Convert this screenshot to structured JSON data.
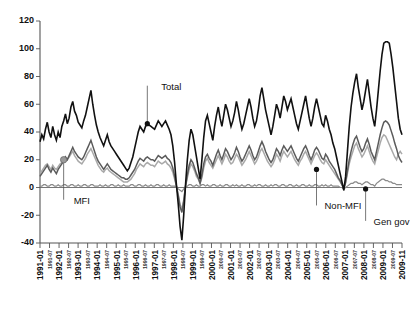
{
  "chart_data": {
    "type": "line",
    "title": "",
    "subtitle": "",
    "xlabel": "",
    "ylabel": "",
    "ylim": [
      -40,
      120
    ],
    "ytick_values": [
      -40,
      -20,
      0,
      20,
      40,
      60,
      80,
      100,
      120
    ],
    "ytick_labels": [
      "-40",
      "-20",
      "0",
      "20",
      "40",
      "60",
      "80",
      "100",
      "120"
    ],
    "grid": false,
    "legend_position": "inline-annotations",
    "x_start": "1991-01",
    "x_end": "2009-11",
    "x_major_labels": [
      "1991-01",
      "1992-01",
      "1993-01",
      "1994-01",
      "1995-01",
      "1996-01",
      "1997-01",
      "1998-01",
      "1999-01",
      "2000-01",
      "2001-01",
      "2002-01",
      "2003-01",
      "2004-01",
      "2005-01",
      "2006-01",
      "2007-01",
      "2008-01",
      "2009-01",
      "2009-11"
    ],
    "x_minor_labels": [
      "1991-07",
      "1992-07",
      "1993-07",
      "1994-07",
      "1995-07",
      "1996-07",
      "1997-07",
      "1998-07",
      "1999-07",
      "2000-07",
      "2001-07",
      "2002-07",
      "2003-07",
      "2004-07",
      "2005-07",
      "2006-07",
      "2007-07",
      "2008-07",
      "2009-07"
    ],
    "x_tick_labels_all": [
      "1991-01",
      "1991-07",
      "1992-01",
      "1992-07",
      "1993-01",
      "1993-07",
      "1994-01",
      "1994-07",
      "1995-01",
      "1995-07",
      "1996-01",
      "1996-07",
      "1997-01",
      "1997-07",
      "1998-01",
      "1998-07",
      "1999-01",
      "1999-07",
      "2000-01",
      "2000-07",
      "2001-01",
      "2001-07",
      "2002-01",
      "2002-07",
      "2003-01",
      "2003-07",
      "2004-01",
      "2004-07",
      "2005-01",
      "2005-07",
      "2006-01",
      "2006-07",
      "2007-01",
      "2007-07",
      "2008-01",
      "2008-07",
      "2009-01",
      "2009-07",
      "2009-11"
    ],
    "series": [
      {
        "name": "Total",
        "color": "#111111",
        "values": [
          33,
          38,
          35,
          42,
          47,
          40,
          36,
          44,
          38,
          34,
          40,
          36,
          44,
          48,
          53,
          46,
          50,
          58,
          62,
          55,
          52,
          47,
          45,
          43,
          48,
          52,
          58,
          64,
          70,
          60,
          52,
          45,
          40,
          36,
          33,
          30,
          34,
          38,
          33,
          30,
          28,
          26,
          24,
          22,
          20,
          18,
          16,
          14,
          12,
          14,
          18,
          22,
          28,
          34,
          40,
          44,
          42,
          40,
          44,
          46,
          45,
          44,
          43,
          42,
          45,
          48,
          46,
          44,
          46,
          48,
          45,
          42,
          38,
          30,
          18,
          2,
          -12,
          -28,
          -38,
          -20,
          2,
          20,
          34,
          42,
          38,
          30,
          22,
          14,
          6,
          20,
          36,
          48,
          52,
          46,
          40,
          34,
          44,
          52,
          58,
          50,
          44,
          52,
          60,
          56,
          50,
          44,
          48,
          54,
          62,
          56,
          48,
          42,
          46,
          52,
          58,
          64,
          58,
          50,
          44,
          48,
          56,
          66,
          72,
          64,
          56,
          50,
          44,
          38,
          44,
          52,
          60,
          56,
          50,
          58,
          66,
          62,
          56,
          60,
          64,
          58,
          52,
          46,
          42,
          48,
          54,
          60,
          66,
          58,
          50,
          44,
          50,
          58,
          64,
          58,
          52,
          46,
          44,
          52,
          48,
          42,
          38,
          32,
          28,
          22,
          16,
          10,
          4,
          -2,
          8,
          26,
          44,
          58,
          68,
          76,
          82,
          72,
          64,
          56,
          62,
          70,
          78,
          68,
          58,
          50,
          44,
          56,
          70,
          84,
          96,
          104,
          105,
          105,
          104,
          96,
          86,
          74,
          62,
          50,
          42,
          38
        ]
      },
      {
        "name": "Non-MFI",
        "color": "#5b5b5b",
        "values": [
          8,
          10,
          12,
          14,
          16,
          13,
          11,
          14,
          12,
          10,
          13,
          15,
          17,
          19,
          22,
          20,
          23,
          26,
          29,
          26,
          24,
          22,
          21,
          20,
          22,
          25,
          28,
          31,
          34,
          30,
          26,
          22,
          19,
          17,
          15,
          13,
          15,
          17,
          15,
          13,
          12,
          11,
          10,
          9,
          8,
          7,
          7,
          6,
          6,
          7,
          9,
          11,
          13,
          16,
          19,
          21,
          20,
          19,
          21,
          22,
          21,
          20,
          20,
          19,
          21,
          23,
          22,
          21,
          22,
          23,
          21,
          20,
          18,
          14,
          8,
          1,
          -6,
          -14,
          -18,
          -10,
          1,
          9,
          16,
          20,
          18,
          14,
          10,
          7,
          3,
          9,
          17,
          22,
          24,
          21,
          19,
          16,
          20,
          24,
          27,
          23,
          20,
          24,
          28,
          26,
          23,
          20,
          22,
          25,
          29,
          26,
          22,
          19,
          21,
          24,
          27,
          30,
          27,
          23,
          20,
          22,
          26,
          30,
          33,
          30,
          26,
          23,
          20,
          18,
          20,
          24,
          28,
          26,
          23,
          27,
          30,
          28,
          26,
          28,
          30,
          27,
          24,
          21,
          19,
          22,
          25,
          28,
          30,
          27,
          23,
          20,
          23,
          27,
          29,
          27,
          24,
          21,
          20,
          24,
          22,
          19,
          17,
          15,
          13,
          10,
          7,
          5,
          2,
          -1,
          4,
          12,
          20,
          26,
          31,
          35,
          37,
          33,
          29,
          26,
          28,
          32,
          35,
          31,
          26,
          23,
          20,
          26,
          32,
          38,
          43,
          47,
          48,
          47,
          45,
          41,
          37,
          32,
          28,
          23,
          20,
          18
        ]
      },
      {
        "name": "MFI",
        "color": "#a9a9a9",
        "values": [
          10,
          12,
          14,
          16,
          17,
          15,
          13,
          16,
          14,
          13,
          15,
          17,
          18,
          20,
          22,
          20,
          22,
          24,
          26,
          23,
          21,
          19,
          18,
          17,
          19,
          21,
          24,
          26,
          28,
          25,
          22,
          19,
          16,
          14,
          12,
          11,
          13,
          14,
          12,
          11,
          10,
          9,
          8,
          7,
          6,
          5,
          4,
          4,
          4,
          5,
          6,
          8,
          10,
          13,
          15,
          17,
          16,
          15,
          17,
          18,
          17,
          16,
          16,
          15,
          17,
          19,
          18,
          17,
          18,
          19,
          17,
          16,
          14,
          11,
          6,
          1,
          -5,
          -12,
          -16,
          -9,
          1,
          7,
          13,
          17,
          15,
          12,
          8,
          6,
          3,
          7,
          14,
          19,
          21,
          18,
          16,
          14,
          17,
          20,
          23,
          20,
          17,
          20,
          24,
          22,
          19,
          17,
          18,
          21,
          24,
          22,
          19,
          16,
          18,
          20,
          23,
          26,
          23,
          20,
          17,
          19,
          22,
          26,
          28,
          25,
          22,
          19,
          17,
          15,
          17,
          20,
          24,
          22,
          19,
          23,
          26,
          24,
          22,
          24,
          26,
          23,
          20,
          18,
          16,
          19,
          21,
          24,
          26,
          23,
          20,
          17,
          20,
          23,
          25,
          23,
          20,
          18,
          17,
          20,
          18,
          16,
          14,
          12,
          10,
          8,
          6,
          4,
          2,
          0,
          3,
          10,
          17,
          22,
          26,
          30,
          32,
          28,
          25,
          22,
          24,
          27,
          30,
          26,
          22,
          19,
          17,
          22,
          27,
          32,
          36,
          38,
          37,
          34,
          31,
          28,
          25,
          22,
          20,
          24,
          26,
          24
        ]
      },
      {
        "name": "Gen gov",
        "color": "#8a8a8a",
        "values": [
          1,
          1,
          2,
          2,
          1,
          1,
          2,
          2,
          1,
          1,
          2,
          1,
          1,
          2,
          2,
          1,
          1,
          2,
          2,
          1,
          1,
          2,
          1,
          1,
          2,
          2,
          1,
          1,
          2,
          2,
          1,
          1,
          1,
          2,
          1,
          1,
          2,
          1,
          1,
          2,
          2,
          1,
          1,
          2,
          1,
          1,
          2,
          1,
          1,
          1,
          2,
          2,
          1,
          1,
          2,
          2,
          1,
          1,
          2,
          1,
          1,
          2,
          1,
          1,
          2,
          2,
          1,
          1,
          2,
          1,
          1,
          2,
          1,
          1,
          1,
          0,
          -1,
          -2,
          -3,
          -1,
          0,
          1,
          2,
          2,
          1,
          1,
          2,
          1,
          1,
          2,
          2,
          1,
          2,
          1,
          1,
          2,
          2,
          1,
          1,
          2,
          1,
          1,
          2,
          2,
          1,
          1,
          2,
          1,
          2,
          1,
          1,
          2,
          1,
          1,
          2,
          2,
          1,
          1,
          2,
          1,
          2,
          2,
          1,
          1,
          2,
          1,
          1,
          2,
          1,
          2,
          2,
          1,
          1,
          2,
          2,
          1,
          1,
          2,
          2,
          1,
          1,
          2,
          1,
          1,
          2,
          2,
          1,
          1,
          2,
          1,
          1,
          2,
          2,
          1,
          1,
          2,
          1,
          2,
          1,
          1,
          2,
          1,
          1,
          1,
          1,
          0,
          0,
          -1,
          0,
          1,
          2,
          3,
          3,
          4,
          4,
          3,
          3,
          2,
          3,
          4,
          4,
          3,
          2,
          2,
          1,
          3,
          4,
          5,
          6,
          6,
          5,
          5,
          4,
          4,
          3,
          3,
          2,
          2,
          2,
          2
        ]
      }
    ],
    "annotations": [
      {
        "label": "Total",
        "series": "Total",
        "point_index": 59,
        "point_value": 46,
        "text_dx": 14,
        "text_dy": -34,
        "marker": "dark"
      },
      {
        "label": "MFI",
        "series": "MFI",
        "point_index": 13,
        "point_value": 20,
        "text_dx": 10,
        "text_dy": 44,
        "marker": "gray"
      },
      {
        "label": "Non-MFI",
        "series": "Non-MFI",
        "point_index": 152,
        "point_value": 13,
        "text_dx": 8,
        "text_dy": 40,
        "marker": "dark"
      },
      {
        "label": "Gen gov",
        "series": "Gen gov",
        "point_index": 179,
        "point_value": -1,
        "text_dx": 8,
        "text_dy": 36,
        "marker": "dark"
      }
    ]
  }
}
